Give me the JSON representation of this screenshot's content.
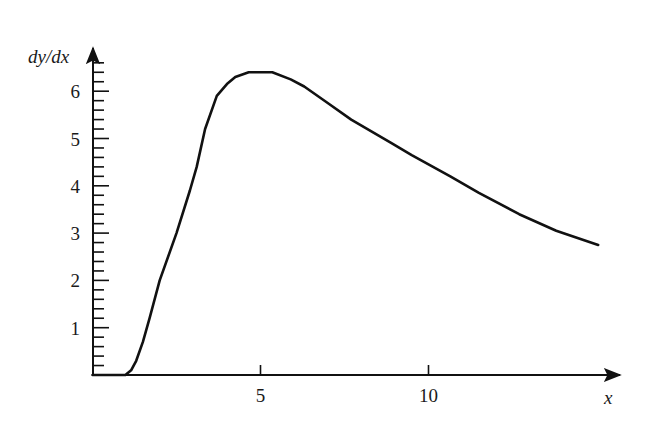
{
  "chart_data": {
    "type": "line",
    "title": "",
    "xlabel": "x",
    "ylabel": "dy/dx",
    "xlim": [
      0,
      15.4
    ],
    "ylim": [
      0,
      6.6
    ],
    "grid": false,
    "legend": null,
    "x_ticks": [
      {
        "value": 5,
        "label": "5"
      },
      {
        "value": 10,
        "label": "10"
      }
    ],
    "y_ticks_major": [
      {
        "value": 1,
        "label": "1"
      },
      {
        "value": 2,
        "label": "2"
      },
      {
        "value": 3,
        "label": "3"
      },
      {
        "value": 4,
        "label": "4"
      },
      {
        "value": 5,
        "label": "5"
      },
      {
        "value": 6,
        "label": "6"
      }
    ],
    "y_minor_step": 0.2,
    "series": [
      {
        "name": "dy/dx",
        "x": [
          0,
          0.98,
          1.15,
          1.3,
          1.5,
          1.7,
          2.0,
          2.5,
          2.9,
          3.1,
          3.35,
          3.7,
          4.0,
          4.25,
          4.65,
          5.35,
          5.9,
          6.3,
          7.0,
          7.7,
          8.9,
          9.5,
          10.65,
          11.5,
          12.7,
          13.8,
          15.05
        ],
        "y": [
          0,
          0.0,
          0.1,
          0.3,
          0.7,
          1.2,
          2.0,
          3.0,
          3.9,
          4.4,
          5.2,
          5.9,
          6.15,
          6.3,
          6.4,
          6.4,
          6.25,
          6.1,
          5.75,
          5.4,
          4.9,
          4.65,
          4.2,
          3.85,
          3.4,
          3.05,
          2.75
        ]
      }
    ]
  }
}
